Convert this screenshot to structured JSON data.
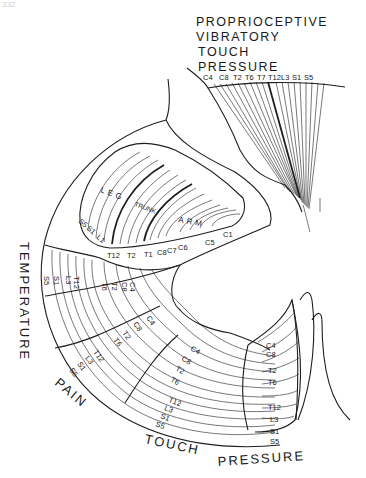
{
  "page_number": "332",
  "dorsal_column": {
    "modalities": [
      "PROPRIOCEPTIVE",
      "VIBRATORY",
      "TOUCH",
      "PRESSURE"
    ],
    "segments": [
      "C4",
      "C8",
      "T2",
      "T6",
      "T7",
      "T12",
      "L3",
      "S1",
      "S5"
    ]
  },
  "lateral_corticospinal": {
    "regions": [
      "LEG",
      "TRUNK",
      "ARM"
    ],
    "leg_segments": [
      "S5",
      "S1",
      "L1"
    ],
    "inner_segments": [
      "T12",
      "T2",
      "T1",
      "C8",
      "C7",
      "C6",
      "C5",
      "C1"
    ]
  },
  "spinothalamic": {
    "modality_labels": {
      "temperature": "TEMPERATURE",
      "pain": "PAIN",
      "touch": "TOUCH",
      "pressure": "PRESSURE"
    },
    "temperature_band": [
      "C4",
      "C8",
      "T2",
      "T6",
      "T12",
      "L3",
      "S1",
      "S5"
    ],
    "pain_band": [
      "C4",
      "C8",
      "T2",
      "T6",
      "T12",
      "L3",
      "S1",
      "S5"
    ],
    "touch_band": [
      "C4",
      "C8",
      "T2",
      "T6",
      "T12",
      "L3",
      "S1",
      "S5"
    ],
    "pressure_band": [
      "C4",
      "C8",
      "T2",
      "T6",
      "T12",
      "L3",
      "S1",
      "S5"
    ]
  }
}
